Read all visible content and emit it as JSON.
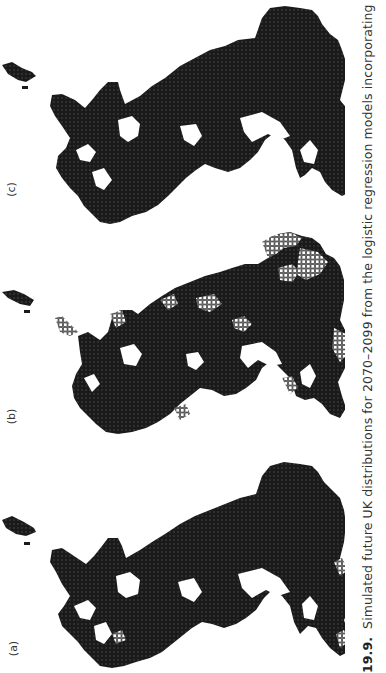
{
  "figure": {
    "number": "19.9.",
    "caption": "Simulated future UK distributions for 2070–2099 from the logistic regression models incorporating climate suitability and",
    "orientation": "rotated 90° counter-clockwise",
    "panels": [
      {
        "id": "a",
        "label": "(a)",
        "description": "Simulated future UK distribution map, grid cells filled black"
      },
      {
        "id": "b",
        "label": "(b)",
        "description": "Simulated future UK distribution map, filled black cells with hollow-square cells at range margins"
      },
      {
        "id": "c",
        "label": "(c)",
        "description": "Simulated future UK distribution map, grid cells filled black"
      }
    ],
    "colors": {
      "occupied_cell": "#111111",
      "hollow_cell_stroke": "#555555",
      "background": "#ffffff",
      "text": "#333333"
    }
  }
}
